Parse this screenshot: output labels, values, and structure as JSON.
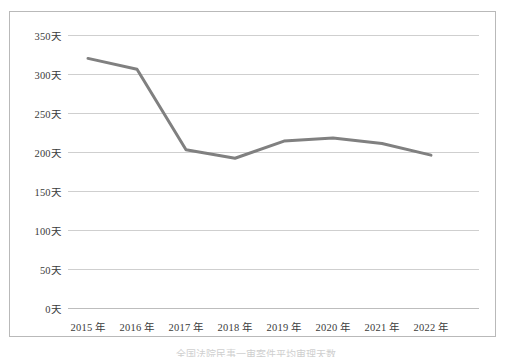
{
  "figure": {
    "caption": "全国法院民事一审案件平均审理天数"
  },
  "chart_data": {
    "type": "line",
    "title": "",
    "subtitle": "",
    "xlabel": "",
    "ylabel": "",
    "categories": [
      "2015 年",
      "2016 年",
      "2017 年",
      "2018 年",
      "2019 年",
      "2020 年",
      "2021 年",
      "2022 年"
    ],
    "values": [
      320,
      306,
      203,
      192,
      214,
      218,
      211,
      196
    ],
    "series": [
      {
        "name": "平均审理天数",
        "values": [
          320,
          306,
          203,
          192,
          214,
          218,
          211,
          196
        ],
        "color": "#808080"
      }
    ],
    "ylim": [
      0,
      350
    ],
    "ytick_values": [
      350,
      300,
      250,
      200,
      150,
      100,
      50,
      0
    ],
    "ytick_labels": [
      "350天",
      "300天",
      "250天",
      "200天",
      "150天",
      "100天",
      "50天",
      "0天"
    ],
    "unit_suffix": "天",
    "grid": true,
    "grid_axis": "y",
    "legend": false,
    "legend_position": "none",
    "line_color": "#808080",
    "line_width": 3,
    "markers": false,
    "gridline_color": "#cfcfcf",
    "border_color": "#b9b9b9",
    "background_color": "#ffffff",
    "tick_label_color": "#3b3b3b"
  }
}
